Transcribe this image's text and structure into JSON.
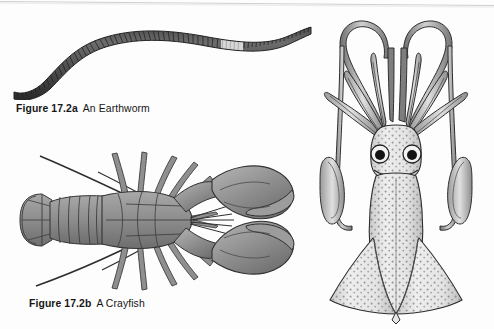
{
  "page": {
    "background_color": "#fdfdfd",
    "width": 494,
    "height": 329,
    "scan_edge": true
  },
  "figures": [
    {
      "id": "earthworm",
      "subject": "earthworm",
      "view": "whole body, lateral sinuous",
      "caption_number": "Figure 17.2a",
      "caption_text": "An Earthworm",
      "ink_color": "#4a4a4a",
      "highlight_color": "#d9d9d9",
      "parts": [
        "segmented body",
        "clitellum",
        "anterior end",
        "posterior end"
      ]
    },
    {
      "id": "crayfish",
      "subject": "crayfish",
      "view": "dorsal",
      "caption_number": "Figure 17.2b",
      "caption_text": "A Crayfish",
      "ink_color": "#8c8c8c",
      "outline_color": "#3a3a3a",
      "parts": [
        "chelipeds",
        "carapace",
        "abdomen",
        "tail fan",
        "walking legs",
        "antennae",
        "rostrum"
      ]
    },
    {
      "id": "squid",
      "subject": "squid",
      "view": "dorsal",
      "caption_number": "",
      "caption_text": "",
      "ink_color": "#6f6f6f",
      "stipple_color": "#5a5a5a",
      "parts": [
        "tentacles",
        "tentacular clubs",
        "arms",
        "eyes",
        "mantle",
        "fins"
      ]
    }
  ],
  "captions": {
    "a": {
      "number": "Figure 17.2a",
      "text": "An Earthworm"
    },
    "b": {
      "number": "Figure 17.2b",
      "text": "A Crayfish"
    }
  }
}
